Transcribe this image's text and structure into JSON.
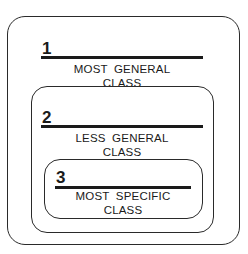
{
  "diagram": {
    "levels": [
      {
        "number": "1",
        "line1": "MOST GENERAL",
        "line2": "CLASS"
      },
      {
        "number": "2",
        "line1": "LESS GENERAL",
        "line2": "CLASS"
      },
      {
        "number": "3",
        "line1": "MOST SPECIFIC",
        "line2": "CLASS"
      }
    ]
  }
}
